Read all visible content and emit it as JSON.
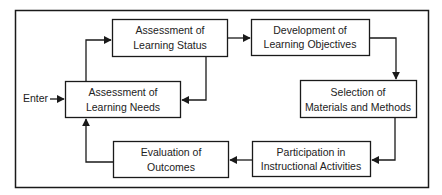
{
  "diagram": {
    "entry_label": "Enter",
    "nodes": [
      {
        "id": "status",
        "line1": "Assessment of",
        "line2": "Learning Status"
      },
      {
        "id": "objectives",
        "line1": "Development of",
        "line2": "Learning Objectives"
      },
      {
        "id": "needs",
        "line1": "Assessment of",
        "line2": "Learning Needs"
      },
      {
        "id": "materials",
        "line1": "Selection of",
        "line2": "Materials and Methods"
      },
      {
        "id": "participation",
        "line1": "Participation in",
        "line2": "Instructional Activities"
      },
      {
        "id": "evaluation",
        "line1": "Evaluation of",
        "line2": "Outcomes"
      }
    ],
    "edges": [
      {
        "from": "entry",
        "to": "needs"
      },
      {
        "from": "needs",
        "to": "status"
      },
      {
        "from": "status",
        "to": "objectives"
      },
      {
        "from": "status",
        "to": "needs"
      },
      {
        "from": "objectives",
        "to": "materials"
      },
      {
        "from": "materials",
        "to": "participation"
      },
      {
        "from": "participation",
        "to": "evaluation"
      },
      {
        "from": "evaluation",
        "to": "needs"
      }
    ],
    "colors": {
      "line": "#1a1a1a",
      "background": "#ffffff",
      "text": "#222222"
    }
  }
}
